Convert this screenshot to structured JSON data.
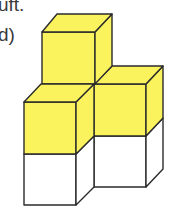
{
  "text": {
    "line1": "uft.",
    "line2": "d)"
  },
  "figure": {
    "cube_count": 5,
    "colors": {
      "yellow": "#FBF35E",
      "white": "#FFFFFF",
      "outline": "#2b2b2b"
    },
    "cubes": [
      {
        "position": "top-back",
        "color": "yellow"
      },
      {
        "position": "front-left-upper",
        "color": "yellow"
      },
      {
        "position": "right-upper",
        "color": "yellow"
      },
      {
        "position": "front-left-lower",
        "color": "white"
      },
      {
        "position": "right-lower",
        "color": "white"
      }
    ]
  }
}
